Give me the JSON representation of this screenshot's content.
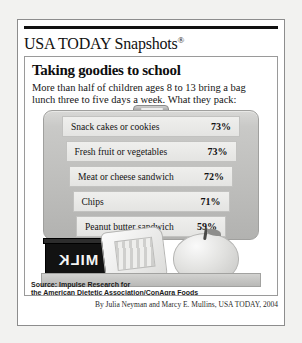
{
  "branding": {
    "logo_text": "USA TODAY Snapshots",
    "registered_mark": "®"
  },
  "headline": "Taking goodies to school",
  "deck_line1": "More than half of children ages 8 to 13 bring a bag",
  "deck_line2": "lunch three to five days a week. What they pack:",
  "illustration": {
    "milk_carton_text": "MILK",
    "handle": "lunchbox-handle"
  },
  "source_line1": "Source: Impulse Research for",
  "source_line2": "the American Dietetic Association/ConAgra Foods",
  "byline": "By Julia Neyman and Marcy E. Mullins, USA TODAY, 2004",
  "chart_data": {
    "type": "bar",
    "title": "Taking goodies to school",
    "subtitle": "More than half of children ages 8 to 13 bring a bag lunch three to five days a week. What they pack:",
    "xlabel": "",
    "ylabel": "",
    "ylim": [
      0,
      100
    ],
    "grid": false,
    "legend": "none",
    "value_suffix": "%",
    "categories": [
      "Snack cakes or cookies",
      "Fresh fruit or vegetables",
      "Meat or cheese sandwich",
      "Chips",
      "Peanut butter sandwich"
    ],
    "values": [
      73,
      73,
      72,
      71,
      59
    ],
    "labels": [
      "73%",
      "73%",
      "72%",
      "71%",
      "59%"
    ],
    "source": "Impulse Research for the American Dietetic Association/ConAgra Foods"
  }
}
